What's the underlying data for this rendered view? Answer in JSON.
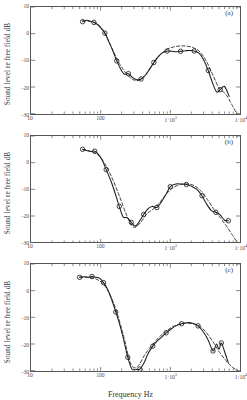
{
  "figure": {
    "xlabel": "Frequency Hz",
    "ylabel": "Sound level re free field dB"
  },
  "axis": {
    "y_ticks": [
      "10",
      "0",
      "-10",
      "-20",
      "-30"
    ],
    "x_ticks": [
      {
        "label": "10",
        "exp": ""
      },
      {
        "label": "100",
        "exp": ""
      },
      {
        "label": "1·10",
        "exp": "3"
      },
      {
        "label": "1·10",
        "exp": "4"
      }
    ]
  },
  "panels": [
    {
      "label": "(a)"
    },
    {
      "label": "(b)"
    },
    {
      "label": "(c)"
    }
  ],
  "chart_data": [
    {
      "type": "line",
      "panel": "(a)",
      "title": "",
      "xlabel": "Frequency Hz",
      "ylabel": "Sound level re free field dB",
      "xscale": "log",
      "xlim": [
        10,
        10000
      ],
      "ylim": [
        -30,
        10
      ],
      "grid": false,
      "legend": "none",
      "series": [
        {
          "name": "measured",
          "style": "solid-with-circle-markers",
          "x": [
            55,
            63,
            70,
            80,
            90,
            100,
            115,
            130,
            150,
            170,
            195,
            220,
            250,
            285,
            330,
            380,
            440,
            500,
            580,
            670,
            770,
            900,
            1050,
            1200,
            1400,
            1650,
            1900,
            2200,
            2600,
            3000,
            3500,
            4000,
            4600,
            5200,
            6000,
            7000
          ],
          "y": [
            4.5,
            5.0,
            4.7,
            4.2,
            3.4,
            2.2,
            0.2,
            -2.8,
            -6.5,
            -10.2,
            -13.4,
            -15.2,
            -15.0,
            -16.4,
            -17.3,
            -17.0,
            -15.6,
            -13.4,
            -10.8,
            -8.6,
            -7.2,
            -6.5,
            -6.6,
            -6.8,
            -6.6,
            -6.4,
            -6.3,
            -6.5,
            -7.4,
            -9.8,
            -13.8,
            -18.2,
            -21.8,
            -21.0,
            -19.8,
            -23.5
          ]
        },
        {
          "name": "model",
          "style": "dashed",
          "x": [
            55,
            70,
            90,
            110,
            140,
            180,
            230,
            290,
            360,
            450,
            560,
            700,
            880,
            1100,
            1400,
            1750,
            2200,
            2700,
            3300,
            4100,
            5000,
            6200,
            7600,
            9000
          ],
          "y": [
            4.8,
            4.6,
            3.6,
            1.0,
            -4.6,
            -10.6,
            -14.8,
            -17.2,
            -17.4,
            -15.0,
            -11.6,
            -8.2,
            -6.0,
            -5.0,
            -4.6,
            -4.7,
            -5.4,
            -7.0,
            -10.4,
            -15.6,
            -20.4,
            -22.6,
            -26.5,
            -30.0
          ]
        }
      ]
    },
    {
      "type": "line",
      "panel": "(b)",
      "title": "",
      "xlabel": "Frequency Hz",
      "ylabel": "Sound level re free field dB",
      "xscale": "log",
      "xlim": [
        10,
        10000
      ],
      "ylim": [
        -30,
        10
      ],
      "grid": false,
      "legend": "none",
      "series": [
        {
          "name": "measured",
          "style": "solid-with-circle-markers",
          "x": [
            55,
            63,
            72,
            82,
            92,
            105,
            120,
            140,
            160,
            185,
            210,
            240,
            275,
            315,
            360,
            415,
            480,
            550,
            640,
            740,
            860,
            1000,
            1200,
            1450,
            1700,
            2000,
            2400,
            2850,
            3300,
            3900,
            4500,
            5200,
            6000,
            6800
          ],
          "y": [
            5.0,
            4.6,
            4.2,
            4.3,
            3.2,
            1.0,
            -2.6,
            -6.8,
            -11.2,
            -16.4,
            -20.4,
            -20.6,
            -22.4,
            -23.8,
            -22.0,
            -19.4,
            -17.2,
            -16.4,
            -16.8,
            -14.8,
            -12.0,
            -9.0,
            -8.0,
            -8.0,
            -8.2,
            -8.8,
            -10.0,
            -12.4,
            -15.4,
            -18.0,
            -18.6,
            -19.6,
            -21.6,
            -21.8
          ]
        },
        {
          "name": "model",
          "style": "dashed",
          "x": [
            55,
            72,
            92,
            115,
            145,
            185,
            235,
            295,
            370,
            460,
            580,
            720,
            900,
            1120,
            1400,
            1750,
            2200,
            2750,
            3400,
            4200,
            5200,
            6400,
            7800,
            9200
          ],
          "y": [
            4.9,
            4.2,
            2.8,
            -0.4,
            -5.6,
            -12.4,
            -19.6,
            -24.2,
            -22.6,
            -19.2,
            -17.2,
            -14.6,
            -11.4,
            -9.2,
            -8.2,
            -8.0,
            -8.6,
            -10.6,
            -13.8,
            -17.4,
            -20.6,
            -23.8,
            -27.2,
            -30.0
          ]
        }
      ]
    },
    {
      "type": "line",
      "panel": "(c)",
      "title": "",
      "xlabel": "Frequency Hz",
      "ylabel": "Sound level re free field dB",
      "xscale": "log",
      "xlim": [
        10,
        10000
      ],
      "ylim": [
        -30,
        10
      ],
      "grid": false,
      "legend": "none",
      "series": [
        {
          "name": "measured",
          "style": "solid-with-circle-markers",
          "x": [
            50,
            58,
            66,
            75,
            85,
            97,
            110,
            125,
            145,
            165,
            190,
            215,
            245,
            280,
            320,
            365,
            420,
            480,
            560,
            650,
            750,
            870,
            1000,
            1200,
            1450,
            1750,
            2100,
            2500,
            3000,
            3500,
            4100,
            4600,
            5000,
            5400,
            6000,
            6800
          ],
          "y": [
            5.0,
            5.2,
            5.0,
            5.3,
            5.0,
            4.6,
            3.0,
            0.6,
            -3.6,
            -8.0,
            -13.2,
            -18.6,
            -25.0,
            -29.4,
            -29.5,
            -29.4,
            -27.0,
            -23.6,
            -20.8,
            -18.8,
            -17.4,
            -15.8,
            -14.6,
            -13.2,
            -12.4,
            -12.0,
            -12.2,
            -13.2,
            -15.6,
            -18.6,
            -22.6,
            -20.0,
            -22.0,
            -19.6,
            -22.8,
            -27.0
          ]
        },
        {
          "name": "model",
          "style": "dashed",
          "x": [
            50,
            66,
            85,
            108,
            136,
            172,
            216,
            272,
            340,
            430,
            540,
            680,
            850,
            1070,
            1340,
            1680,
            2100,
            2650,
            3300,
            4150,
            5000,
            6200,
            7700,
            9400
          ],
          "y": [
            5.1,
            5.0,
            4.4,
            2.6,
            -1.4,
            -8.4,
            -17.6,
            -27.6,
            -28.4,
            -24.0,
            -20.6,
            -17.6,
            -15.4,
            -13.6,
            -12.6,
            -12.2,
            -12.4,
            -13.4,
            -15.8,
            -19.4,
            -22.8,
            -26.0,
            -28.6,
            -30.0
          ]
        }
      ]
    }
  ]
}
